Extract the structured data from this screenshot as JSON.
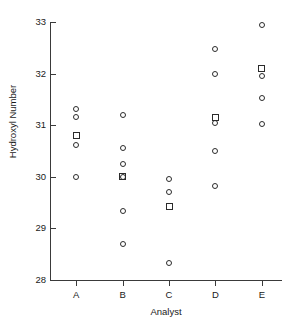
{
  "chart_data": {
    "type": "scatter",
    "title": "",
    "xlabel": "Analyst",
    "ylabel": "Hydroxyl Number",
    "categories": [
      "A",
      "B",
      "C",
      "D",
      "E"
    ],
    "ylim": [
      28,
      33
    ],
    "yticks": [
      28,
      29,
      30,
      31,
      32,
      33
    ],
    "ytick_labels": [
      "28",
      "29",
      "30",
      "31",
      "32",
      "33"
    ],
    "grid": false,
    "legend": "none",
    "marker_types": {
      "circle": "individual measurement",
      "square": "group mean"
    },
    "series": [
      {
        "name": "Individual measurements",
        "marker": "circle",
        "points": [
          {
            "category": "A",
            "value": 31.32
          },
          {
            "category": "A",
            "value": 31.16
          },
          {
            "category": "A",
            "value": 30.62
          },
          {
            "category": "A",
            "value": 30.0
          },
          {
            "category": "B",
            "value": 31.2
          },
          {
            "category": "B",
            "value": 30.56
          },
          {
            "category": "B",
            "value": 30.24
          },
          {
            "category": "B",
            "value": 30.0
          },
          {
            "category": "B",
            "value": 29.33
          },
          {
            "category": "B",
            "value": 28.7
          },
          {
            "category": "C",
            "value": 29.95
          },
          {
            "category": "C",
            "value": 29.7
          },
          {
            "category": "C",
            "value": 28.32
          },
          {
            "category": "D",
            "value": 32.48
          },
          {
            "category": "D",
            "value": 32.0
          },
          {
            "category": "D",
            "value": 31.05
          },
          {
            "category": "D",
            "value": 30.5
          },
          {
            "category": "D",
            "value": 29.82
          },
          {
            "category": "E",
            "value": 32.95
          },
          {
            "category": "E",
            "value": 31.95
          },
          {
            "category": "E",
            "value": 31.52
          },
          {
            "category": "E",
            "value": 31.02
          }
        ]
      },
      {
        "name": "Group means",
        "marker": "square",
        "points": [
          {
            "category": "A",
            "value": 30.8
          },
          {
            "category": "B",
            "value": 30.0
          },
          {
            "category": "C",
            "value": 29.42
          },
          {
            "category": "D",
            "value": 31.15
          },
          {
            "category": "E",
            "value": 32.1
          }
        ]
      }
    ]
  }
}
